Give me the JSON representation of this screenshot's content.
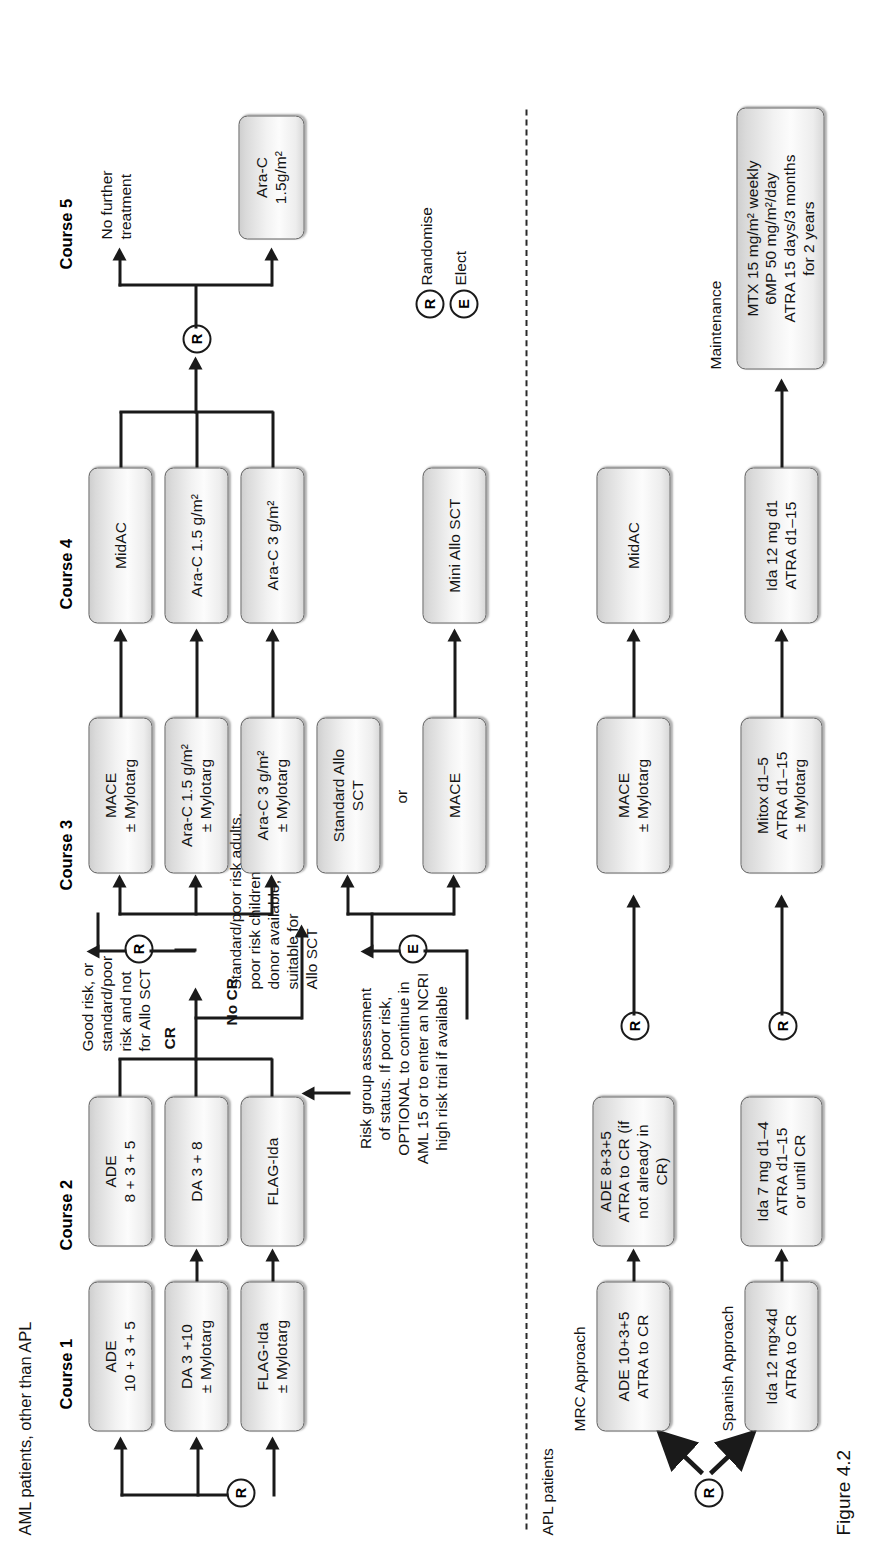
{
  "figure": {
    "caption": "Figure 4.2"
  },
  "legend": {
    "randomise": {
      "symbol": "R",
      "label": "Randomise"
    },
    "elect": {
      "symbol": "E",
      "label": "Elect"
    }
  },
  "aml": {
    "section_label": "AML patients, other than APL",
    "course_headers": [
      "Course 1",
      "Course 2",
      "Course 3",
      "Course 4",
      "Course 5"
    ],
    "entry_node": "R",
    "course1": [
      {
        "id": "ade-10-3-5",
        "text": "ADE\n10 + 3 + 5"
      },
      {
        "id": "da-3-10-mylotarg",
        "text": "DA 3 +10\n± Mylotarg"
      },
      {
        "id": "flag-ida-mylotarg",
        "text": "FLAG-Ida\n± Mylotarg"
      }
    ],
    "course2": [
      {
        "id": "ade-8-3-5",
        "text": "ADE\n8 + 3 + 5"
      },
      {
        "id": "da-3-8",
        "text": "DA 3 + 8"
      },
      {
        "id": "flag-ida",
        "text": "FLAG-Ida"
      }
    ],
    "course3": [
      {
        "id": "mace-mylotarg",
        "text": "MACE\n± Mylotarg"
      },
      {
        "id": "arac-1-5-mylotarg",
        "text": "Ara-C 1.5 g/m²\n± Mylotarg"
      },
      {
        "id": "arac-3-mylotarg",
        "text": "Ara-C 3 g/m²\n± Mylotarg"
      },
      {
        "id": "standard-allo-sct",
        "text": "Standard Allo\nSCT"
      },
      {
        "id": "mace",
        "text": "MACE"
      }
    ],
    "course4": [
      {
        "id": "midac",
        "text": "MidAC"
      },
      {
        "id": "arac-1-5",
        "text": "Ara-C 1.5 g/m²"
      },
      {
        "id": "arac-3",
        "text": "Ara-C 3 g/m²"
      },
      {
        "id": "mini-allo-sct",
        "text": "Mini Allo SCT"
      }
    ],
    "course5": [
      {
        "id": "arac-1-5gm2",
        "text": "Ara-C\n1.5g/m²"
      }
    ],
    "labels": {
      "no_further_treatment": "No further\ntreatment",
      "or": "or",
      "cr": "CR",
      "no_cr": "No CR",
      "good_risk": "Good risk, or\nstandard/poor\nrisk and not\nfor Allo SCT",
      "standard_poor_risk": "Standard/poor risk adults,\npoor risk children\ndonor available,\nsuitable for\nAllo SCT",
      "risk_group_note": "Risk group assessment\nof status. If poor risk,\nOPTIONAL to continue in\nAML 15 or to enter an NCRI\nhigh risk trial if available"
    },
    "nodes": {
      "course2_to_3_randomise": "R",
      "allo_elect": "E",
      "course4_to_5_randomise": "R"
    }
  },
  "apl": {
    "section_label": "APL patients",
    "entry_node": "R",
    "approach_labels": [
      "MRC Approach",
      "Spanish Approach"
    ],
    "maintenance_label": "Maintenance",
    "mrc": {
      "course1": "ADE 10+3+5\nATRA to CR",
      "course2": "ADE 8+3+5\nATRA to CR (if\nnot already in\nCR)",
      "course3": "MACE\n± Mylotarg",
      "course4": "MidAC",
      "randomise": "R"
    },
    "spanish": {
      "course1": "Ida 12 mg×4d\nATRA to CR",
      "course2": "Ida 7 mg d1–4\nATRA d1–15\nor until CR",
      "course3": "Mitox d1–5\nATRA d1–15\n± Mylotarg",
      "course4": "Ida 12 mg d1\nATRA d1–15",
      "randomise": "R"
    },
    "maintenance": "MTX 15 mg/m² weekly\n6MP 50 mg/m²/day\nATRA 15 days/3 months\nfor 2 years"
  }
}
